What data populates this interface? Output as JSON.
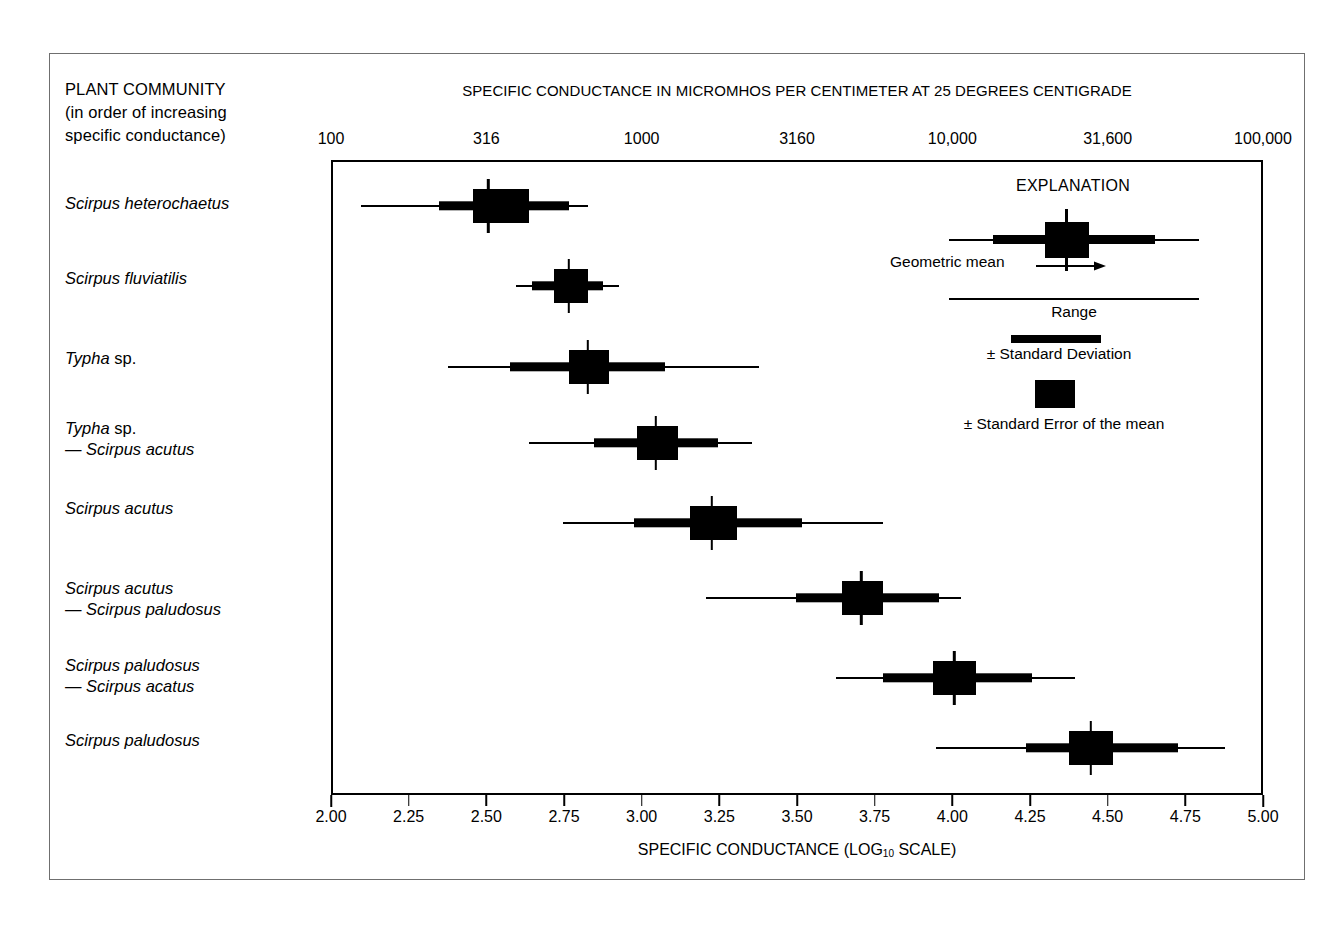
{
  "figure": {
    "left_header_lines": [
      "PLANT COMMUNITY",
      "(in order of increasing",
      "specific conductance)"
    ],
    "top_title": "SPECIFIC CONDUCTANCE IN MICROMHOS PER CENTIMETER AT 25 DEGREES CENTIGRADE",
    "bottom_title_main": "SPECIFIC CONDUCTANCE (LOG",
    "bottom_title_sub": "10",
    "bottom_title_tail": "SCALE)"
  },
  "legend": {
    "title": "EXPLANATION",
    "geometric_mean_label": "Geometric mean",
    "range_label": "Range",
    "sd_label": "± Standard Deviation",
    "se_label": "± Standard Error of the mean"
  },
  "chart_data": {
    "type": "bar",
    "title": "SPECIFIC CONDUCTANCE IN MICROMHOS PER CENTIMETER AT 25 DEGREES CENTIGRADE",
    "subtitle": "Box-and-whisker of specific conductance by plant community",
    "xlabel": "SPECIFIC CONDUCTANCE (LOG 10 SCALE)",
    "ylabel": "PLANT COMMUNITY (in order of increasing specific conductance)",
    "xlim": [
      2.0,
      5.0
    ],
    "grid": false,
    "legend_position": "upper-right-inside",
    "top_axis": {
      "label": "SPECIFIC CONDUCTANCE IN MICROMHOS PER CENTIMETER AT 25 DEGREES CENTIGRADE",
      "tick_values": [
        2.0,
        2.5,
        3.0,
        3.5,
        4.0,
        4.5,
        5.0
      ],
      "tick_labels": [
        "100",
        "316",
        "1000",
        "3160",
        "10,000",
        "31,600",
        "100,000"
      ]
    },
    "bottom_axis": {
      "label": "SPECIFIC CONDUCTANCE (LOG 10 SCALE)",
      "tick_values": [
        2.0,
        2.25,
        2.5,
        2.75,
        3.0,
        3.25,
        3.5,
        3.75,
        4.0,
        4.25,
        4.5,
        4.75,
        5.0
      ],
      "tick_labels": [
        "2.00",
        "2.25",
        "2.50",
        "2.75",
        "3.00",
        "3.25",
        "3.50",
        "3.75",
        "4.00",
        "4.25",
        "4.50",
        "4.75",
        "5.00"
      ]
    },
    "categories": [
      "Scirpus heterochaetus",
      "Scirpus fluviatilis",
      "Typha sp.",
      "Typha sp. — Scirpus acutus",
      "Scirpus acutus",
      "Scirpus acutus — Scirpus paludosus",
      "Scirpus paludosus — Scirpus acatus",
      "Scirpus paludosus"
    ],
    "series": [
      {
        "name": "Geometric mean (log10)",
        "values": [
          2.5,
          2.76,
          2.82,
          3.04,
          3.22,
          3.7,
          4.0,
          4.44
        ]
      },
      {
        "name": "Range min (log10)",
        "values": [
          2.09,
          2.59,
          2.37,
          2.63,
          2.74,
          3.2,
          3.62,
          3.94
        ]
      },
      {
        "name": "Range max (log10)",
        "values": [
          2.82,
          2.92,
          3.37,
          3.35,
          3.77,
          4.02,
          4.39,
          4.87
        ]
      },
      {
        "name": "-1 Standard Deviation (log10)",
        "values": [
          2.34,
          2.64,
          2.57,
          2.84,
          2.97,
          3.49,
          3.77,
          4.23
        ]
      },
      {
        "name": "+1 Standard Deviation (log10)",
        "values": [
          2.76,
          2.87,
          3.07,
          3.24,
          3.51,
          3.95,
          4.25,
          4.72
        ]
      },
      {
        "name": "-1 Standard Error (log10)",
        "values": [
          2.45,
          2.71,
          2.76,
          2.98,
          3.15,
          3.64,
          3.93,
          4.37
        ]
      },
      {
        "name": "+1 Standard Error (log10)",
        "values": [
          2.63,
          2.82,
          2.89,
          3.11,
          3.3,
          3.77,
          4.07,
          4.51
        ]
      }
    ]
  },
  "rows": [
    {
      "label_html": "<i>Scirpus heterochaetus</i>",
      "mean": 2.5,
      "range_min": 2.09,
      "range_max": 2.82,
      "sd_min": 2.34,
      "sd_max": 2.76,
      "se_min": 2.45,
      "se_max": 2.63
    },
    {
      "label_html": "<i>Scirpus fluviatilis</i>",
      "mean": 2.76,
      "range_min": 2.59,
      "range_max": 2.92,
      "sd_min": 2.64,
      "sd_max": 2.87,
      "se_min": 2.71,
      "se_max": 2.82
    },
    {
      "label_html": "<i>Typha</i> sp.",
      "mean": 2.82,
      "range_min": 2.37,
      "range_max": 3.37,
      "sd_min": 2.57,
      "sd_max": 3.07,
      "se_min": 2.76,
      "se_max": 2.89
    },
    {
      "label_html": "<i>Typha</i> sp.<br>— <i>Scirpus acutus</i>",
      "mean": 3.04,
      "range_min": 2.63,
      "range_max": 3.35,
      "sd_min": 2.84,
      "sd_max": 3.24,
      "se_min": 2.98,
      "se_max": 3.11
    },
    {
      "label_html": "<i>Scirpus acutus</i>",
      "mean": 3.22,
      "range_min": 2.74,
      "range_max": 3.77,
      "sd_min": 2.97,
      "sd_max": 3.51,
      "se_min": 3.15,
      "se_max": 3.3
    },
    {
      "label_html": "<i>Scirpus acutus</i><br>— <i>Scirpus paludosus</i>",
      "mean": 3.7,
      "range_min": 3.2,
      "range_max": 4.02,
      "sd_min": 3.49,
      "sd_max": 3.95,
      "se_min": 3.64,
      "se_max": 3.77
    },
    {
      "label_html": "<i>Scirpus paludosus</i><br>— <i>Scirpus acatus</i>",
      "mean": 4.0,
      "range_min": 3.62,
      "range_max": 4.39,
      "sd_min": 3.77,
      "sd_max": 4.25,
      "se_min": 3.93,
      "se_max": 4.07
    },
    {
      "label_html": "<i>Scirpus paludosus</i>",
      "mean": 4.44,
      "range_min": 3.94,
      "range_max": 4.87,
      "sd_min": 4.23,
      "sd_max": 4.72,
      "se_min": 4.37,
      "se_max": 4.51
    }
  ],
  "row_geometry": {
    "label_tops": [
      193,
      268,
      348,
      418,
      498,
      578,
      655,
      730
    ],
    "glyph_centers": [
      203,
      283,
      364,
      440,
      520,
      595,
      675,
      745
    ]
  }
}
